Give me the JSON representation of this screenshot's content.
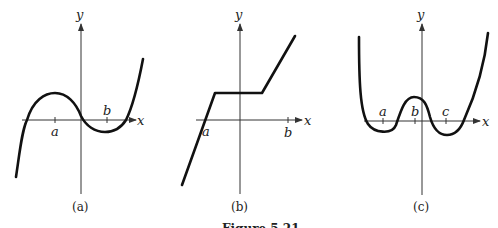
{
  "figure": {
    "caption": "Figure 5.21",
    "panels": [
      {
        "id": "a",
        "caption": "(a)",
        "x_axis_label": "x",
        "y_axis_label": "y",
        "ticks": [
          "a",
          "b"
        ],
        "description": "cubic-like curve: rises from lower left, local max above a, passes near origin, local min near b, rises to upper right"
      },
      {
        "id": "b",
        "caption": "(b)",
        "x_axis_label": "x",
        "y_axis_label": "y",
        "ticks": [
          "a",
          "b"
        ],
        "description": "piecewise linear: steep line crossing x-axis at a, horizontal plateau above axis, then rising line to upper right"
      },
      {
        "id": "c",
        "caption": "(c)",
        "x_axis_label": "x",
        "y_axis_label": "y",
        "ticks": [
          "a",
          "b",
          "c"
        ],
        "description": "W-shaped quartic-like curve: local minima near a and c below axis, local max near b above axis"
      }
    ]
  }
}
